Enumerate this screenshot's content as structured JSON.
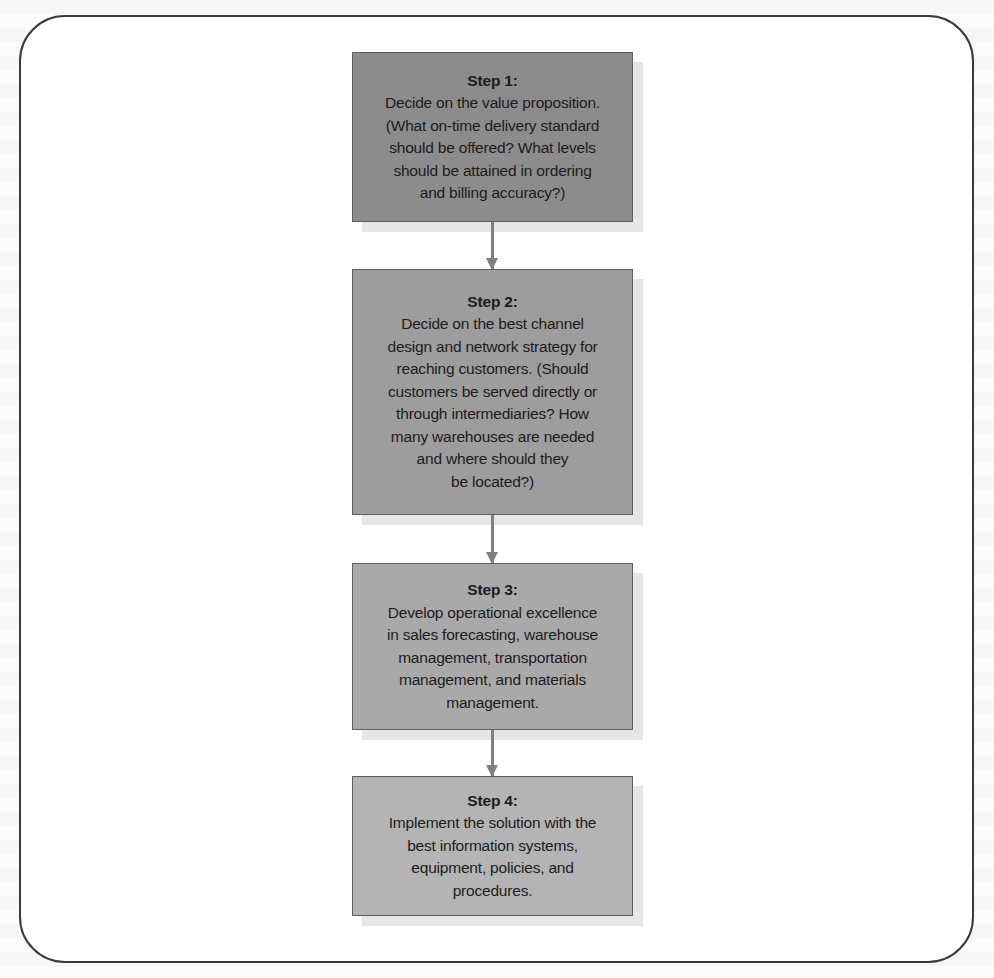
{
  "diagram": {
    "type": "vertical-flowchart",
    "steps": [
      {
        "title": "Step 1:",
        "body": "Decide on the value proposition.\n(What on-time delivery standard\nshould be offered? What levels\nshould be attained in ordering\nand billing accuracy?)",
        "fill": "#8c8c8c"
      },
      {
        "title": "Step 2:",
        "body": "Decide on the best channel\ndesign and network strategy for\nreaching customers. (Should\ncustomers be served directly or\nthrough intermediaries? How\nmany warehouses are needed\nand where should they\nbe located?)",
        "fill": "#9d9d9d"
      },
      {
        "title": "Step 3:",
        "body": "Develop operational excellence\nin sales forecasting, warehouse\nmanagement, transportation\nmanagement, and materials\nmanagement.",
        "fill": "#a9a9a9"
      },
      {
        "title": "Step 4:",
        "body": "Implement the solution with the\nbest information systems,\nequipment, policies, and\nprocedures.",
        "fill": "#b4b4b4"
      }
    ],
    "connectors": [
      {
        "from": "Step 1",
        "to": "Step 2"
      },
      {
        "from": "Step 2",
        "to": "Step 3"
      },
      {
        "from": "Step 3",
        "to": "Step 4"
      }
    ],
    "colors": {
      "frame_border": "#3a3a3a",
      "arrow": "#7f7f7f",
      "text": "#1c1c1c",
      "shadow": "#e6e6e6"
    }
  }
}
